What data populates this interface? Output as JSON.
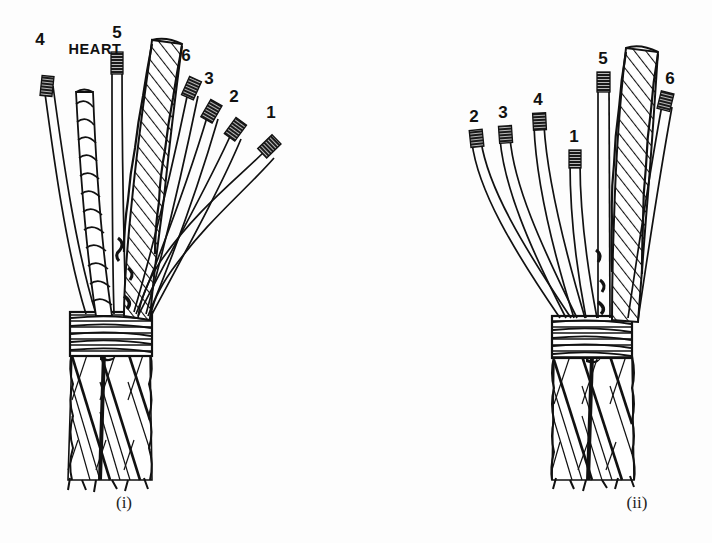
{
  "figure": {
    "background_color": "#fdfdfd",
    "ink_color": "#111111",
    "panels": [
      {
        "id": "panel-i",
        "caption": "(i)",
        "description": "Six-strand wire rope opened out above a seizing, showing six numbered strands and the fibre heart (core).",
        "has_heart": true,
        "heart_label": "HEART",
        "strand_labels": [
          "4",
          "5",
          "6",
          "3",
          "2",
          "1"
        ],
        "seizing_turns": 7,
        "rope_strand_count": 6,
        "labels": [
          {
            "name": "strand-4",
            "text": "4",
            "x": 40,
            "y": 45
          },
          {
            "name": "heart",
            "text": "HEART",
            "x": 67,
            "y": 54
          },
          {
            "name": "strand-5",
            "text": "5",
            "x": 115,
            "y": 38
          },
          {
            "name": "strand-6",
            "text": "6",
            "x": 185,
            "y": 58
          },
          {
            "name": "strand-3",
            "text": "3",
            "x": 208,
            "y": 80
          },
          {
            "name": "strand-2",
            "text": "2",
            "x": 233,
            "y": 98
          },
          {
            "name": "strand-1",
            "text": "1",
            "x": 270,
            "y": 112
          }
        ],
        "caption_pos": {
          "x": 124,
          "y": 508
        }
      },
      {
        "id": "panel-ii",
        "caption": "(ii)",
        "description": "Six-strand wire rope opened out above a seizing with the strands re-ordered; no heart shown.",
        "has_heart": false,
        "heart_label": null,
        "strand_labels": [
          "2",
          "3",
          "4",
          "1",
          "5",
          "6"
        ],
        "seizing_turns": 7,
        "rope_strand_count": 6,
        "labels": [
          {
            "name": "strand-2",
            "text": "2",
            "x": 474,
            "y": 119
          },
          {
            "name": "strand-3",
            "text": "3",
            "x": 503,
            "y": 114
          },
          {
            "name": "strand-4",
            "text": "4",
            "x": 536,
            "y": 100
          },
          {
            "name": "strand-1",
            "text": "1",
            "x": 571,
            "y": 130
          },
          {
            "name": "strand-5",
            "text": "5",
            "x": 601,
            "y": 60
          },
          {
            "name": "strand-6",
            "text": "6",
            "x": 668,
            "y": 75
          }
        ],
        "caption_pos": {
          "x": 637,
          "y": 508
        }
      }
    ]
  }
}
